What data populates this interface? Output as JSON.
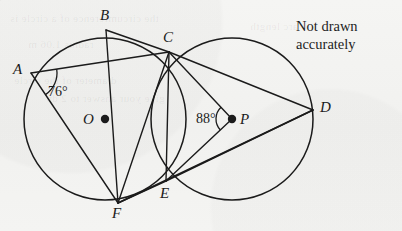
{
  "figure": {
    "type": "geometry-diagram",
    "background_color": "#f3f3f1",
    "stroke_color": "#1b1b1b",
    "note": {
      "line1": "Not drawn",
      "line2": "accurately"
    },
    "circles": [
      {
        "name": "circle-O",
        "center_label": "O",
        "cx": 105,
        "cy": 119,
        "r": 81
      },
      {
        "name": "circle-P",
        "center_label": "P",
        "cx": 232,
        "cy": 119,
        "r": 81
      }
    ],
    "centers": [
      {
        "label": "O",
        "x": 105,
        "y": 119,
        "label_x": 83,
        "label_y": 112
      },
      {
        "label": "P",
        "x": 232,
        "y": 119,
        "label_x": 240,
        "label_y": 112
      }
    ],
    "points": [
      {
        "label": "A",
        "x": 31,
        "y": 73,
        "label_x": 13,
        "label_y": 62
      },
      {
        "label": "B",
        "x": 106,
        "y": 30,
        "label_x": 100,
        "label_y": 8
      },
      {
        "label": "C",
        "x": 169,
        "y": 52,
        "label_x": 163,
        "label_y": 30
      },
      {
        "label": "D",
        "x": 313,
        "y": 110,
        "label_x": 320,
        "label_y": 100
      },
      {
        "label": "E",
        "x": 166,
        "y": 181,
        "label_x": 160,
        "label_y": 186
      },
      {
        "label": "F",
        "x": 118,
        "y": 203,
        "label_x": 112,
        "label_y": 206
      }
    ],
    "segments": [
      {
        "name": "AC",
        "from": "A",
        "to": "C"
      },
      {
        "name": "AF",
        "from": "A",
        "to": "F"
      },
      {
        "name": "BC",
        "from": "B",
        "to": "C"
      },
      {
        "name": "BF",
        "from": "B",
        "to": "F"
      },
      {
        "name": "CE",
        "from": "C",
        "to": "E"
      },
      {
        "name": "CD",
        "from": "C",
        "to": "D"
      },
      {
        "name": "CF",
        "from": "C",
        "to": "F"
      },
      {
        "name": "ED",
        "from": "E",
        "to": "D"
      },
      {
        "name": "EF",
        "from": "E",
        "to": "F"
      },
      {
        "name": "FD",
        "from": "F",
        "to": "D"
      },
      {
        "name": "PC",
        "from": "P",
        "to": "C"
      },
      {
        "name": "PE",
        "from": "P",
        "to": "E"
      }
    ],
    "angles": [
      {
        "name": "angle-at-A",
        "value": "76°",
        "vertex": "A",
        "between": [
          "AC",
          "AF"
        ],
        "label_x": 48,
        "label_y": 85,
        "arc_radius": 26
      },
      {
        "name": "angle-at-P",
        "value": "88°",
        "vertex": "P",
        "between": [
          "PC",
          "PE"
        ],
        "label_x": 196,
        "label_y": 112,
        "arc_radius": 16
      }
    ]
  },
  "ghost_artifacts": [
    {
      "text": "the circumference of a circle is",
      "x": 10,
      "y": 12
    },
    {
      "text": "radius 1.06 m",
      "x": 28,
      "y": 38
    },
    {
      "text": "diameter of the circle",
      "x": 14,
      "y": 74
    },
    {
      "text": "give your answer to 2 dp",
      "x": 46,
      "y": 92
    },
    {
      "text": "arc length",
      "x": 250,
      "y": 20
    }
  ]
}
